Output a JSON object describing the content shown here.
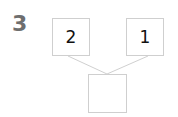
{
  "question_number": "3",
  "number_bond": {
    "part_left": "2",
    "part_right": "1",
    "whole": ""
  },
  "colors": {
    "box_border": "#cfcfcf",
    "line": "#d0d0d0",
    "question_number": "#6e6e6e"
  }
}
